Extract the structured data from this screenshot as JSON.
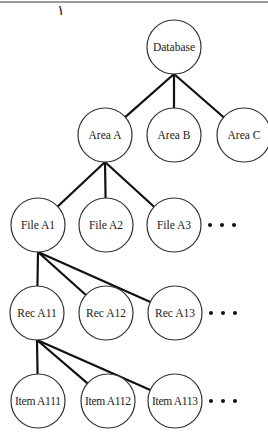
{
  "page": {
    "mark": "١"
  },
  "tree": {
    "root": {
      "id": "database",
      "label": "Database",
      "cx": 174,
      "cy": 47
    },
    "levels": [
      {
        "name": "areas",
        "nodes": [
          {
            "id": "area-a",
            "label": "Area A",
            "cx": 105,
            "cy": 135,
            "parent": "database"
          },
          {
            "id": "area-b",
            "label": "Area B",
            "cx": 174,
            "cy": 135,
            "parent": "database"
          },
          {
            "id": "area-c",
            "label": "Area C",
            "cx": 244,
            "cy": 135,
            "parent": "database"
          }
        ],
        "has_more": false
      },
      {
        "name": "files",
        "nodes": [
          {
            "id": "file-a1",
            "label": "File A1",
            "cx": 38,
            "cy": 225,
            "parent": "area-a"
          },
          {
            "id": "file-a2",
            "label": "File A2",
            "cx": 106,
            "cy": 225,
            "parent": "area-a"
          },
          {
            "id": "file-a3",
            "label": "File A3",
            "cx": 174,
            "cy": 225,
            "parent": "area-a"
          }
        ],
        "has_more": true,
        "ellipsis": "• • •"
      },
      {
        "name": "records",
        "nodes": [
          {
            "id": "rec-a11",
            "label": "Rec A11",
            "cx": 37,
            "cy": 313,
            "parent": "file-a1"
          },
          {
            "id": "rec-a12",
            "label": "Rec A12",
            "cx": 106,
            "cy": 313,
            "parent": "file-a1"
          },
          {
            "id": "rec-a13",
            "label": "Rec A13",
            "cx": 175,
            "cy": 313,
            "parent": "file-a1"
          }
        ],
        "has_more": true,
        "ellipsis": "• • •"
      },
      {
        "name": "items",
        "nodes": [
          {
            "id": "item-a111",
            "label": "Item A111",
            "cx": 38,
            "cy": 401,
            "parent": "rec-a11"
          },
          {
            "id": "item-a112",
            "label": "Item A112",
            "cx": 108,
            "cy": 401,
            "parent": "rec-a11"
          },
          {
            "id": "item-a113",
            "label": "Item A113",
            "cx": 175,
            "cy": 401,
            "parent": "rec-a11"
          }
        ],
        "has_more": true,
        "ellipsis": "• • •"
      }
    ],
    "node_radius": 27,
    "colors": {
      "edge": "#111111",
      "node_stroke": "#333333",
      "node_fill": "#ffffff",
      "text": "#222222"
    }
  }
}
